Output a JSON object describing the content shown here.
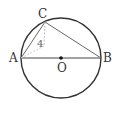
{
  "diagram": {
    "type": "geometry",
    "circle": {
      "center": "O",
      "cx": 61,
      "cy": 58,
      "r": 40,
      "stroke": "#333333"
    },
    "points": {
      "A": {
        "label": "A",
        "x": 21,
        "y": 58
      },
      "B": {
        "label": "B",
        "x": 101,
        "y": 58
      },
      "C": {
        "label": "C",
        "x": 45,
        "y": 22
      },
      "O": {
        "label": "O",
        "x": 61,
        "y": 58
      }
    },
    "segments": [
      {
        "from": "A",
        "to": "B",
        "style": "solid"
      },
      {
        "from": "A",
        "to": "C",
        "style": "solid"
      },
      {
        "from": "C",
        "to": "B",
        "style": "solid"
      },
      {
        "from": "C",
        "to": "D",
        "style": "dashed"
      },
      {
        "from": "A",
        "to": "D",
        "style": "dashed"
      }
    ],
    "annotations": [
      {
        "text": "4",
        "x": 40,
        "y": 46
      }
    ],
    "colors": {
      "main": "#333333",
      "light": "#bbbbbb"
    }
  }
}
